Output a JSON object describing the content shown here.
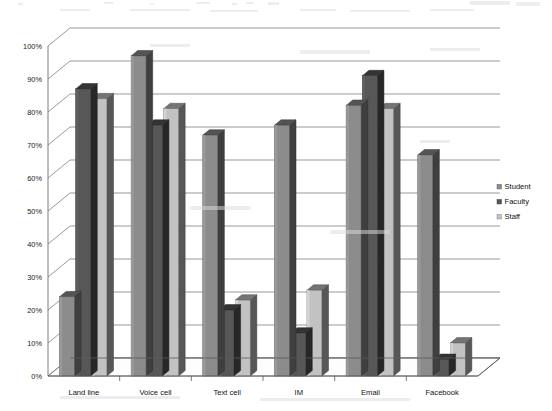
{
  "chart_data": {
    "type": "bar",
    "title": "",
    "subtitle": "",
    "xlabel": "",
    "ylabel": "",
    "ylim": [
      0,
      100
    ],
    "ytick_labels": [
      "0%",
      "10%",
      "20%",
      "30%",
      "40%",
      "50%",
      "60%",
      "70%",
      "80%",
      "90%",
      "100%"
    ],
    "ytick_values": [
      0,
      10,
      20,
      30,
      40,
      50,
      60,
      70,
      80,
      90,
      100
    ],
    "categories": [
      "Land line",
      "Voice cell",
      "Text cell",
      "IM",
      "Email",
      "Facebook"
    ],
    "grid": true,
    "legend_position": "right",
    "style": "3d-column",
    "series": [
      {
        "name": "Student",
        "color": "#8c8c8c",
        "values": [
          24,
          97,
          73,
          76,
          82,
          67
        ]
      },
      {
        "name": "Faculty",
        "color": "#575757",
        "values": [
          87,
          76,
          20,
          13,
          91,
          5
        ]
      },
      {
        "name": "Staff",
        "color": "#c2c2c2",
        "values": [
          84,
          81,
          23,
          26,
          81,
          10
        ]
      }
    ]
  },
  "legend": {
    "items": [
      {
        "label": "Student",
        "color": "#8c8c8c"
      },
      {
        "label": "Faculty",
        "color": "#575757"
      },
      {
        "label": "Staff",
        "color": "#c2c2c2"
      }
    ]
  },
  "colors": {
    "student": "#8c8c8c",
    "faculty": "#575757",
    "staff": "#c2c2c2",
    "gridline": "#6e6e6e",
    "axis": "#5a5a5a",
    "text": "#111111",
    "background": "#ffffff"
  }
}
